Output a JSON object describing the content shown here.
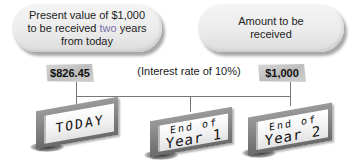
{
  "bubbles": {
    "left": {
      "line1": "Present value of $1,000",
      "line2_pre": "to be received ",
      "line2_accent": "two",
      "line2_post": " years",
      "line3": "from today"
    },
    "right": {
      "line1": "Amount to be",
      "line2": "received"
    }
  },
  "tags": {
    "present_value": "$826.45",
    "future_amount": "$1,000"
  },
  "interest_rate_label": "(Interest rate of 10%)",
  "signs": {
    "today": "TODAY",
    "year1": {
      "line1": "End of",
      "line2": "Year 1"
    },
    "year2": {
      "line1": "End of",
      "line2": "Year 2"
    }
  },
  "colors": {
    "accent_text": "#7a6ea8",
    "connector_line": "#777777",
    "tag_fill": "#c8c8c8"
  }
}
